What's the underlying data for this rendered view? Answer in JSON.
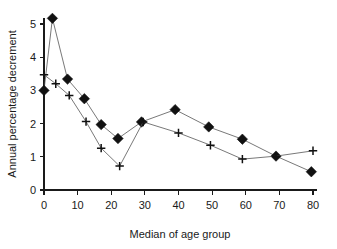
{
  "chart_data": {
    "type": "line",
    "title": "",
    "subtitle": "",
    "xlabel": "Median of age group",
    "ylabel": "Annual percentage decrement",
    "xlim": [
      0,
      80
    ],
    "ylim": [
      0,
      5
    ],
    "xticks": [
      0,
      10,
      20,
      30,
      40,
      50,
      60,
      70,
      80
    ],
    "yticks": [
      0,
      1,
      2,
      3,
      4,
      5
    ],
    "xtick_labels": [
      "0",
      "10",
      "20",
      "30",
      "40",
      "50",
      "60",
      "70",
      "80"
    ],
    "ytick_labels": [
      "0",
      "1",
      "2",
      "3",
      "4",
      "5"
    ],
    "grid": false,
    "legend": "none",
    "series": [
      {
        "name": "diamond-series",
        "marker": "diamond",
        "color": "#111111",
        "x": [
          0,
          2.5,
          7,
          12,
          17,
          22,
          29,
          39,
          49,
          59,
          69,
          79.5
        ],
        "values": [
          3.0,
          5.17,
          3.34,
          2.75,
          1.97,
          1.55,
          2.05,
          2.42,
          1.9,
          1.53,
          1.02,
          0.55
        ]
      },
      {
        "name": "plus-series",
        "marker": "plus",
        "color": "#111111",
        "x": [
          0,
          3.5,
          7.5,
          12.5,
          17,
          22.5,
          29.5,
          40,
          49.5,
          59,
          69,
          80
        ],
        "values": [
          3.47,
          3.2,
          2.85,
          2.06,
          1.26,
          0.72,
          2.05,
          1.72,
          1.35,
          0.93,
          1.02,
          1.18
        ]
      }
    ]
  }
}
